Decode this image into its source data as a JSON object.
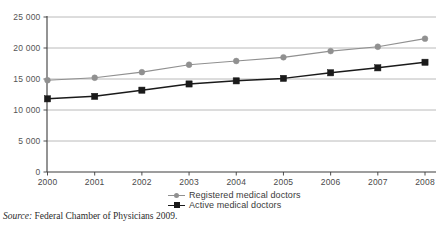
{
  "chart_data": {
    "type": "line",
    "title": "",
    "subtitle": "",
    "xlabel": "",
    "ylabel": "",
    "categories": [
      "2000",
      "2001",
      "2002",
      "2003",
      "2004",
      "2005",
      "2006",
      "2007",
      "2008"
    ],
    "x": [
      2000,
      2001,
      2002,
      2003,
      2004,
      2005,
      2006,
      2007,
      2008
    ],
    "series": [
      {
        "name": "Registered medical doctors",
        "color": "#909090",
        "marker": "circle",
        "values": [
          14800,
          15200,
          16100,
          17300,
          17900,
          18500,
          19500,
          20200,
          21500
        ]
      },
      {
        "name": "Active medical doctors",
        "color": "#1a1a1a",
        "marker": "square",
        "values": [
          11800,
          12200,
          13200,
          14200,
          14700,
          15100,
          16000,
          16800,
          17700
        ]
      }
    ],
    "ylim": [
      0,
      25000
    ],
    "ytick_values": [
      0,
      5000,
      10000,
      15000,
      20000,
      25000
    ],
    "ytick_labels": [
      "0",
      "5 000",
      "10 000",
      "15 000",
      "20 000",
      "25 000"
    ],
    "xtick_labels": [
      "2000",
      "2001",
      "2002",
      "2003",
      "2004",
      "2005",
      "2006",
      "2007",
      "2008"
    ],
    "grid": true,
    "grid_axis": "y",
    "legend_position": "bottom-center"
  },
  "legend": {
    "items": [
      {
        "label": "Registered medical doctors",
        "color": "#909090",
        "marker": "circle"
      },
      {
        "label": "Active medical doctors",
        "color": "#1a1a1a",
        "marker": "square"
      }
    ]
  },
  "source": {
    "prefix": "Source:",
    "text": " Federal Chamber of Physicians 2009."
  },
  "colors": {
    "registered": "#909090",
    "active": "#1a1a1a",
    "gridline": "#a8a8a8",
    "axis": "#3c3c3c",
    "tick_text": "#555555"
  }
}
